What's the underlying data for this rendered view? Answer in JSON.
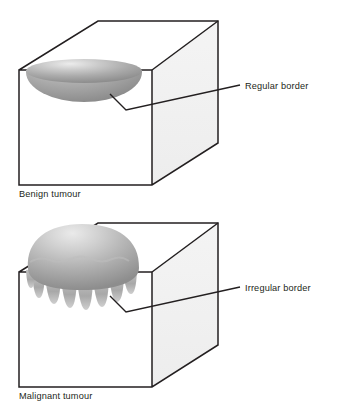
{
  "figure": {
    "background_color": "#ffffff",
    "ink_color": "#231f20",
    "panel_count": 2
  },
  "panels": [
    {
      "id": "benign",
      "caption": "Benign tumour",
      "callout_label": "Regular border",
      "tumour": {
        "shape_name": "smooth-ellipse-tumour",
        "border_type": "regular",
        "lobe_count": 0,
        "fill_light": "#e8e8e8",
        "fill_mid": "#b0b0b0",
        "fill_dark": "#8e8e8e"
      },
      "box": {
        "front_face_color": "#ffffff",
        "side_face_color": "#f1f1f1",
        "top_face_color": "#ffffff",
        "edge_color": "#231f20"
      }
    },
    {
      "id": "malignant",
      "caption": "Malignant tumour",
      "callout_label": "Irregular border",
      "tumour": {
        "shape_name": "lobulated-dome-tumour",
        "border_type": "irregular",
        "lobe_count": 8,
        "fill_light": "#e4e4e4",
        "fill_mid": "#b4b4b4",
        "fill_dark": "#909090"
      },
      "box": {
        "front_face_color": "#ffffff",
        "side_face_color": "#f1f1f1",
        "top_face_color": "#ffffff",
        "edge_color": "#231f20"
      }
    }
  ]
}
